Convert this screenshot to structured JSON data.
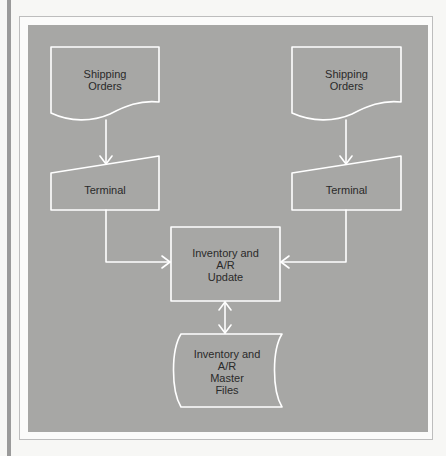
{
  "diagram": {
    "type": "system flowchart",
    "colors": {
      "panel": "#a7a7a5",
      "lines": "#ffffff",
      "text": "#2a2a2a",
      "frame": "#bdbdbd"
    },
    "nodes": [
      {
        "id": "doc_left",
        "shape": "document",
        "label_lines": [
          "Shipping",
          "Orders"
        ]
      },
      {
        "id": "doc_right",
        "shape": "document",
        "label_lines": [
          "Shipping",
          "Orders"
        ]
      },
      {
        "id": "term_left",
        "shape": "manual-input",
        "label_lines": [
          "Terminal"
        ]
      },
      {
        "id": "term_right",
        "shape": "manual-input",
        "label_lines": [
          "Terminal"
        ]
      },
      {
        "id": "update",
        "shape": "process",
        "label_lines": [
          "Inventory and",
          "A/R",
          "Update"
        ]
      },
      {
        "id": "master",
        "shape": "stored-data",
        "label_lines": [
          "Inventory and",
          "A/R",
          "Master",
          "Files"
        ]
      }
    ],
    "edges": [
      {
        "from": "doc_left",
        "to": "term_left",
        "direction": "one-way"
      },
      {
        "from": "doc_right",
        "to": "term_right",
        "direction": "one-way"
      },
      {
        "from": "term_left",
        "to": "update",
        "direction": "one-way"
      },
      {
        "from": "term_right",
        "to": "update",
        "direction": "one-way"
      },
      {
        "from": "update",
        "to": "master",
        "direction": "two-way"
      }
    ]
  }
}
